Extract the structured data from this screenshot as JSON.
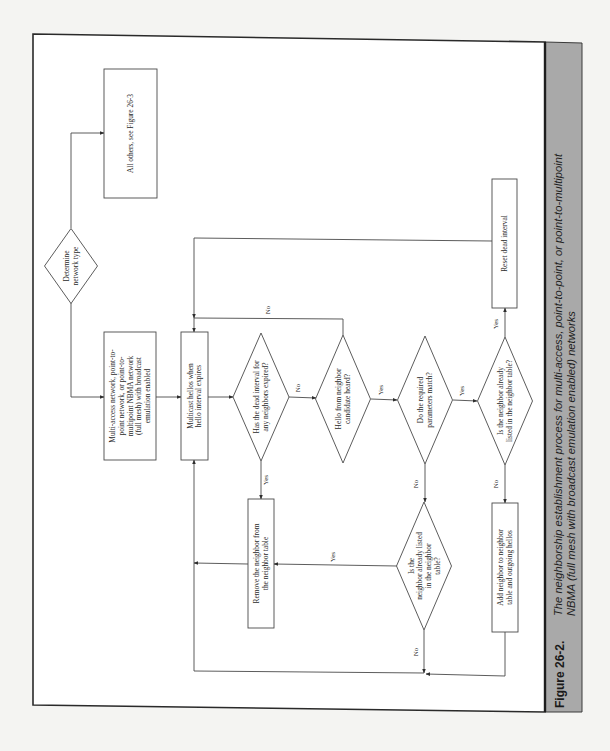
{
  "figure": {
    "number": "Figure 26-2.",
    "caption_lines": [
      "The neighborship establishment process for multi-access, point-to-point, or point-to-multipoint",
      "NBMA (full mesh with broadcast emulation enabled) networks"
    ]
  },
  "colors": {
    "page": "#f4f4f2",
    "frame_bg": "#ffffff",
    "caption_band": "#a9a9a9",
    "line": "#4a4a4a"
  },
  "nodes": [
    {
      "id": "determine",
      "type": "decision",
      "name": "determine-network-type-decision",
      "cx": 71,
      "cy": 266,
      "w": 53,
      "h": 75,
      "lines": [
        "Determine",
        "network type"
      ]
    },
    {
      "id": "all-others",
      "type": "process",
      "name": "all-others-box",
      "x": 104,
      "y": 69,
      "w": 53,
      "h": 129,
      "lines": [
        "All others, see Figure 26-3"
      ]
    },
    {
      "id": "multi-access",
      "type": "process",
      "name": "network-type-box",
      "x": 104,
      "y": 332,
      "w": 52,
      "h": 128,
      "lines": [
        "Multi-access network, point-to-",
        "point network, or point-to-",
        "multipoint NBMA network",
        "(full mesh) with broadcast",
        "emulation enabled"
      ]
    },
    {
      "id": "multicast",
      "type": "process",
      "name": "multicast-hellos-box",
      "x": 181,
      "y": 332,
      "w": 27,
      "h": 128,
      "lines": [
        "Multicast hellos when",
        "hello interval expires"
      ]
    },
    {
      "id": "dead-expired",
      "type": "decision",
      "name": "dead-interval-expired-decision",
      "cx": 261,
      "cy": 397,
      "w": 56,
      "h": 128,
      "lines": [
        "Has the dead interval for",
        "any neighbors expired?"
      ]
    },
    {
      "id": "hello-heard",
      "type": "decision",
      "name": "hello-heard-decision",
      "cx": 343,
      "cy": 399,
      "w": 55,
      "h": 128,
      "lines": [
        "Hello from neighbor",
        "candidate heard?"
      ]
    },
    {
      "id": "params-match",
      "type": "decision",
      "name": "parameters-match-decision",
      "cx": 425,
      "cy": 400,
      "w": 55,
      "h": 128,
      "lines": [
        "Do the required",
        "parameters match?"
      ]
    },
    {
      "id": "listed-a",
      "type": "decision",
      "name": "already-listed-decision",
      "cx": 505,
      "cy": 401,
      "w": 55,
      "h": 128,
      "lines": [
        "Is the neighbor already",
        "listed in the neighbor table?"
      ]
    },
    {
      "id": "reset-dead",
      "type": "process",
      "name": "reset-dead-interval-box",
      "x": 492,
      "y": 179,
      "w": 25,
      "h": 129,
      "lines": [
        "Reset dead interval"
      ]
    },
    {
      "id": "remove-neighbor",
      "type": "process",
      "name": "remove-neighbor-box",
      "x": 248,
      "y": 499,
      "w": 26,
      "h": 129,
      "lines": [
        "Remove the neighbor from",
        "the neighbor table"
      ]
    },
    {
      "id": "listed-b",
      "type": "decision",
      "name": "listed-after-mismatch-decision",
      "cx": 424,
      "cy": 566,
      "w": 55,
      "h": 128,
      "lines": [
        "Is the",
        "neighbor already listed",
        "in the neighbor",
        "table?"
      ]
    },
    {
      "id": "add-neighbor",
      "type": "process",
      "name": "add-neighbor-box",
      "x": 492,
      "y": 503,
      "w": 26,
      "h": 129,
      "lines": [
        "Add neighbor to neighbor",
        "table and outgoing hellos"
      ]
    }
  ],
  "edges": [
    {
      "name": "edge-determine-to-all-others",
      "points": [
        [
          71,
          228
        ],
        [
          71,
          133
        ],
        [
          104,
          133
        ]
      ],
      "arrow": true
    },
    {
      "name": "edge-determine-to-multi-access",
      "points": [
        [
          71,
          303
        ],
        [
          71,
          397
        ],
        [
          104,
          397
        ]
      ],
      "arrow": true
    },
    {
      "name": "edge-multi-access-to-multicast",
      "points": [
        [
          156,
          397
        ],
        [
          181,
          397
        ]
      ],
      "arrow": true
    },
    {
      "name": "edge-multicast-to-dead",
      "points": [
        [
          208,
          397
        ],
        [
          233,
          397
        ]
      ],
      "arrow": true
    },
    {
      "name": "edge-dead-no-to-hello",
      "points": [
        [
          289,
          397
        ],
        [
          316,
          398
        ]
      ],
      "arrow": true,
      "label": "No",
      "lx": 300,
      "ly": 388
    },
    {
      "name": "edge-dead-yes-to-remove",
      "points": [
        [
          261,
          461
        ],
        [
          261,
          499
        ]
      ],
      "arrow": true,
      "label": "Yes",
      "lx": 268,
      "ly": 480
    },
    {
      "name": "edge-hello-no-to-multicast",
      "points": [
        [
          343,
          335
        ],
        [
          343,
          319
        ],
        [
          194,
          318
        ],
        [
          194,
          332
        ]
      ],
      "arrow": true,
      "label": "No",
      "lx": 270,
      "ly": 310
    },
    {
      "name": "edge-hello-yes-to-params",
      "points": [
        [
          371,
          399
        ],
        [
          397,
          400
        ]
      ],
      "arrow": true,
      "label": "Yes",
      "lx": 383,
      "ly": 390
    },
    {
      "name": "edge-params-yes-to-listed",
      "points": [
        [
          453,
          400
        ],
        [
          477,
          401
        ]
      ],
      "arrow": true,
      "label": "Yes",
      "lx": 464,
      "ly": 391
    },
    {
      "name": "edge-params-no-to-listed-b",
      "points": [
        [
          425,
          464
        ],
        [
          425,
          502
        ]
      ],
      "arrow": true,
      "label": "No",
      "lx": 418,
      "ly": 484
    },
    {
      "name": "edge-listed-yes-to-reset",
      "points": [
        [
          505,
          337
        ],
        [
          505,
          308
        ]
      ],
      "arrow": true,
      "label": "Yes",
      "lx": 498,
      "ly": 324
    },
    {
      "name": "edge-reset-to-multicast",
      "points": [
        [
          492,
          241
        ],
        [
          194,
          238
        ],
        [
          194,
          318
        ]
      ],
      "arrow": true
    },
    {
      "name": "edge-listed-no-to-add",
      "points": [
        [
          505,
          465
        ],
        [
          505,
          503
        ]
      ],
      "arrow": true,
      "label": "No",
      "lx": 498,
      "ly": 484
    },
    {
      "name": "edge-listed-b-yes-to-remove",
      "points": [
        [
          397,
          566
        ],
        [
          274,
          564
        ]
      ],
      "arrow": true,
      "label": "Yes",
      "lx": 335,
      "ly": 557
    },
    {
      "name": "edge-remove-to-multicast-loop",
      "points": [
        [
          248,
          564
        ],
        [
          194,
          563
        ]
      ],
      "arrow": true
    },
    {
      "name": "edge-listed-b-no-to-bottom",
      "points": [
        [
          424,
          630
        ],
        [
          424,
          673
        ]
      ],
      "arrow": true,
      "label": "No",
      "lx": 418,
      "ly": 652
    },
    {
      "name": "edge-add-to-bottom",
      "points": [
        [
          505,
          632
        ],
        [
          505,
          676
        ],
        [
          426,
          674
        ]
      ],
      "arrow": true
    },
    {
      "name": "edge-bottom-loop-to-multicast",
      "points": [
        [
          424,
          673
        ],
        [
          194,
          671
        ],
        [
          194,
          460
        ]
      ],
      "arrow": true
    }
  ]
}
